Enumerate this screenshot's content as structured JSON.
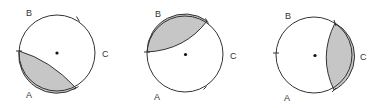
{
  "figure": {
    "background": "#ffffff",
    "shade_color": "#c6c6c6",
    "stroke_color": "#333333",
    "panels": [
      {
        "id": "panel-1",
        "center": [
          57,
          53
        ],
        "radius": 38,
        "shaded_region": "segment between left point and lower-right point (side A)",
        "labels": {
          "B": "B",
          "C": "C",
          "A": "A"
        },
        "label_positions": {
          "B": [
            26,
            16
          ],
          "C": [
            102,
            57
          ],
          "A": [
            26,
            98
          ]
        },
        "ticks": [
          [
            78,
            19
          ],
          [
            19,
            51
          ],
          [
            76,
            88
          ]
        ],
        "chord": [
          [
            19,
            51
          ],
          [
            76,
            88
          ]
        ]
      },
      {
        "id": "panel-2",
        "center": [
          185,
          54
        ],
        "radius": 38,
        "shaded_region": "segment between left point and upper-right point (side B)",
        "labels": {
          "B": "B",
          "C": "C",
          "A": "A"
        },
        "label_positions": {
          "B": [
            155,
            17
          ],
          "C": [
            230,
            59
          ],
          "A": [
            154,
            100
          ]
        },
        "ticks": [
          [
            207,
            21
          ],
          [
            147,
            52
          ],
          [
            205,
            88
          ]
        ],
        "chord": [
          [
            147,
            52
          ],
          [
            207,
            21
          ]
        ]
      },
      {
        "id": "panel-3",
        "center": [
          314,
          55
        ],
        "radius": 38,
        "shaded_region": "segment between upper point and lower point (side C)",
        "labels": {
          "B": "B",
          "C": "C",
          "A": "A"
        },
        "label_positions": {
          "B": [
            285,
            19
          ],
          "C": [
            360,
            60
          ],
          "A": [
            284,
            101
          ]
        },
        "ticks": [
          [
            335,
            23
          ],
          [
            276,
            53
          ],
          [
            334,
            90
          ]
        ],
        "chord": [
          [
            335,
            23
          ],
          [
            334,
            90
          ]
        ]
      }
    ]
  }
}
